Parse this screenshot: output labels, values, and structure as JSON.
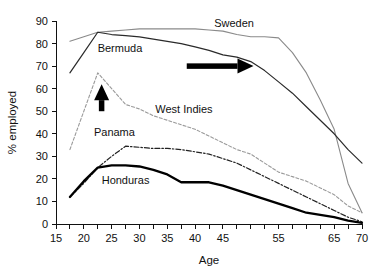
{
  "chart_data": {
    "type": "line",
    "title": "",
    "xlabel": "Age",
    "ylabel": "% employed",
    "xlim": [
      15,
      70
    ],
    "ylim": [
      0,
      90
    ],
    "grid": false,
    "legend_position": "inline-labels",
    "x_ticks": [
      15,
      17.5,
      20,
      22.5,
      25,
      27.5,
      30,
      32.5,
      35,
      37.5,
      40,
      42.5,
      45,
      47.5,
      50,
      52.5,
      55,
      57.5,
      60,
      62.5,
      65,
      67.5,
      70
    ],
    "x_tick_labels": [
      "15",
      "",
      "20",
      "",
      "25",
      "",
      "30",
      "",
      "35",
      "",
      "40",
      "",
      "45",
      "",
      "",
      "",
      "55",
      "",
      "",
      "",
      "65",
      "",
      "70"
    ],
    "y_ticks": [
      0,
      10,
      20,
      30,
      40,
      50,
      60,
      70,
      80,
      90
    ],
    "y_tick_labels": [
      "0",
      "10",
      "20",
      "30",
      "40",
      "50",
      "60",
      "70",
      "80",
      "90"
    ],
    "series": [
      {
        "name": "Sweden",
        "style": "thin-solid-gray",
        "color": "#8a8a8a",
        "width": 1.1,
        "dash": "none",
        "label_x": 47,
        "label_y": 89,
        "x": [
          17.5,
          20,
          22.5,
          25,
          27.5,
          30,
          32.5,
          35,
          37.5,
          40,
          42.5,
          45,
          47.5,
          50,
          52.5,
          55,
          57.5,
          60,
          62.5,
          65,
          67.5,
          70
        ],
        "y": [
          81,
          83,
          85,
          85.5,
          86,
          86.5,
          86.5,
          86.5,
          86.5,
          86.5,
          86,
          85.5,
          84,
          83,
          83,
          82.5,
          76,
          67,
          55,
          42,
          18,
          5
        ]
      },
      {
        "name": "Bermuda",
        "style": "thin-solid-dark",
        "color": "#2a2a2a",
        "width": 1.2,
        "dash": "none",
        "label_x": 26.5,
        "label_y": 78,
        "x": [
          17.5,
          20,
          22.5,
          25,
          27.5,
          30,
          32.5,
          35,
          37.5,
          40,
          42.5,
          45,
          47.5,
          50,
          52.5,
          55,
          57.5,
          60,
          62.5,
          65,
          67.5,
          70
        ],
        "y": [
          67,
          76,
          85,
          84,
          83.5,
          83,
          82,
          81,
          80,
          78.5,
          77,
          75,
          74,
          72,
          68,
          63,
          58,
          52,
          46,
          40,
          33,
          27
        ]
      },
      {
        "name": "West Indies",
        "style": "thin-dashed-gray",
        "color": "#9a9a9a",
        "width": 1.1,
        "dash": "3,2",
        "label_x": 38,
        "label_y": 51,
        "x": [
          17.5,
          20,
          22.5,
          25,
          27.5,
          30,
          32.5,
          35,
          37.5,
          40,
          42.5,
          45,
          47.5,
          50,
          52.5,
          55,
          57.5,
          60,
          62.5,
          65,
          67.5,
          70
        ],
        "y": [
          33,
          50,
          67,
          60,
          53,
          51,
          48,
          46,
          44,
          42,
          39,
          36,
          33,
          31,
          27,
          23,
          21,
          19,
          16,
          13,
          8,
          5
        ]
      },
      {
        "name": "Panama",
        "style": "dash-dot-dark",
        "color": "#222222",
        "width": 1.2,
        "dash": "5,2,1.5,2",
        "label_x": 25.5,
        "label_y": 41,
        "x": [
          17.5,
          20,
          22.5,
          25,
          27.5,
          30,
          32.5,
          35,
          37.5,
          40,
          42.5,
          45,
          47.5,
          50,
          52.5,
          55,
          57.5,
          60,
          62.5,
          65,
          67.5,
          70
        ],
        "y": [
          12,
          18,
          25,
          30,
          34.5,
          34,
          33.5,
          33.5,
          33,
          32,
          31,
          29,
          27,
          24,
          21,
          18,
          15,
          12,
          9,
          6,
          3,
          1
        ]
      },
      {
        "name": "Honduras",
        "style": "thick-solid-black",
        "color": "#000000",
        "width": 2.3,
        "dash": "none",
        "label_x": 27.5,
        "label_y": 19.5,
        "x": [
          17.5,
          20,
          22.5,
          25,
          27.5,
          30,
          32.5,
          35,
          37.5,
          40,
          42.5,
          45,
          47.5,
          50,
          52.5,
          55,
          57.5,
          60,
          62.5,
          65,
          67.5,
          70
        ],
        "y": [
          12,
          19,
          25,
          26,
          26,
          25.5,
          24,
          22,
          18.5,
          18.5,
          18.5,
          17,
          15,
          13,
          11,
          9,
          7,
          5,
          4,
          3,
          1.5,
          0.5
        ]
      }
    ],
    "annotations": [
      {
        "type": "arrow",
        "name": "rightward-trend-arrow",
        "direction": "right",
        "x_from": 38.5,
        "x_to": 50.5,
        "y_at": 70
      },
      {
        "type": "arrow",
        "name": "upward-trend-arrow",
        "direction": "up",
        "x_at": 23.2,
        "y_from": 50,
        "y_to": 62
      }
    ]
  }
}
